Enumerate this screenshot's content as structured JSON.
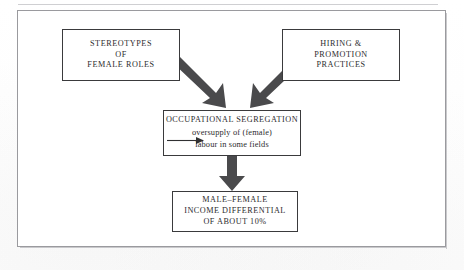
{
  "diagram": {
    "type": "flowchart",
    "nodes": {
      "stereotypes": {
        "id": "stereotypes",
        "lines": [
          "STEREOTYPES",
          "OF",
          "FEMALE ROLES"
        ]
      },
      "hiring": {
        "id": "hiring",
        "lines": [
          "HIRING &",
          "PROMOTION",
          "PRACTICES"
        ]
      },
      "occupational": {
        "id": "occupational",
        "heading": "OCCUPATIONAL SEGREGATION",
        "sub_lines": [
          "oversupply of (female)",
          "labour in some fields"
        ]
      },
      "income": {
        "id": "income",
        "lines": [
          "MALE–FEMALE",
          "INCOME DIFFERENTIAL",
          "OF ABOUT 10%"
        ]
      }
    },
    "arrows": [
      {
        "id": "stereotypes-to-occupational",
        "style": "thick-block",
        "direction": "down-right"
      },
      {
        "id": "hiring-to-occupational",
        "style": "thick-block",
        "direction": "down-left"
      },
      {
        "id": "occupational-to-income",
        "style": "thick-block",
        "direction": "down"
      },
      {
        "id": "segregation-causes-oversupply",
        "style": "thin-line",
        "direction": "right"
      }
    ],
    "colors": {
      "arrow_fill": "#4a4a4c",
      "box_border": "#3a3a3c",
      "frame_border": "#9a9a9e",
      "text": "#2c2c2e",
      "background": "#ffffff"
    }
  }
}
